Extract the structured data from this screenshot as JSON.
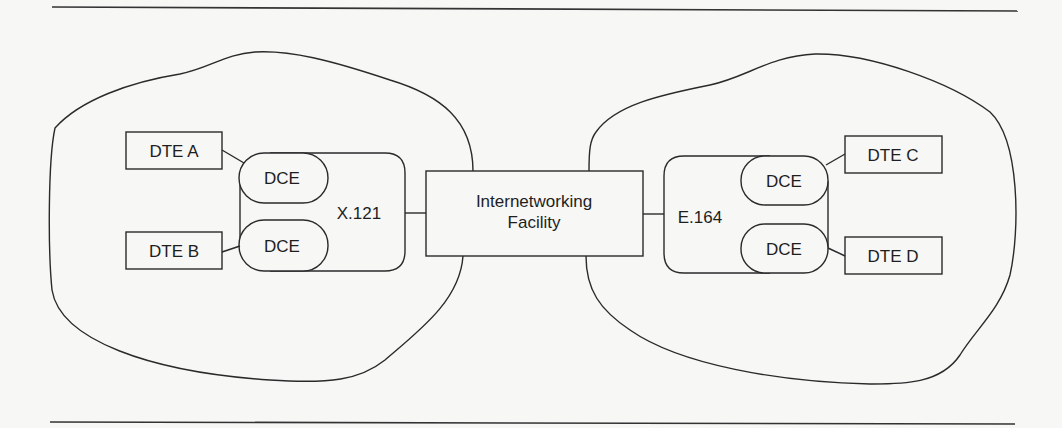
{
  "diagram": {
    "facility": {
      "line1": "Internetworking",
      "line2": "Facility"
    },
    "left_network": {
      "label": "X.121",
      "dce_top": "DCE",
      "dce_bottom": "DCE",
      "dte_top": "DTE A",
      "dte_bottom": "DTE B"
    },
    "right_network": {
      "label": "E.164",
      "dce_top": "DCE",
      "dce_bottom": "DCE",
      "dte_top": "DTE C",
      "dte_bottom": "DTE D"
    }
  },
  "colors": {
    "background": "#f7f7f6",
    "stroke": "#2a2a2a",
    "text": "#1e1e1e"
  }
}
